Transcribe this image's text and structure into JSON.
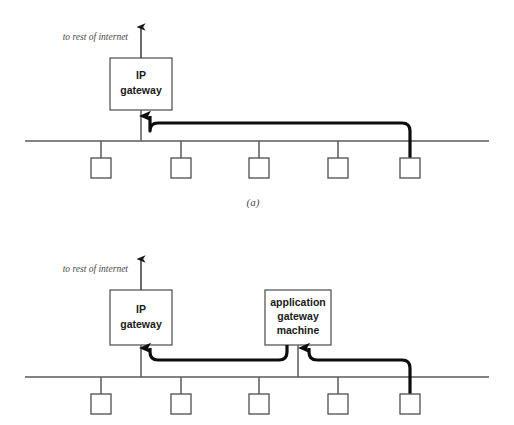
{
  "figure": {
    "width": 514,
    "height": 425,
    "background_color": "#ffffff",
    "line_color": "#5a5a5a",
    "cable_color": "#0d0d0d",
    "text_color": "#1a1a1a"
  },
  "panel_a": {
    "caption": "(a)",
    "internet_label": "to rest of internet",
    "gateway_box": {
      "line1": "IP",
      "line2": "gateway"
    },
    "host_count": 5
  },
  "panel_b": {
    "caption": "",
    "internet_label": "to rest of internet",
    "gateway_box": {
      "line1": "IP",
      "line2": "gateway"
    },
    "app_gateway_box": {
      "line1": "application",
      "line2": "gateway",
      "line3": "machine"
    },
    "host_count": 5
  }
}
